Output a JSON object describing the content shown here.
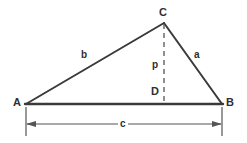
{
  "diagram": {
    "type": "triangle-with-altitude",
    "background_color": "#ffffff",
    "stroke_color": "#3a3a3a",
    "dim_stroke_color": "#555555",
    "labels": {
      "vertex_a": "A",
      "vertex_b": "B",
      "vertex_c": "C",
      "foot_d": "D",
      "side_a": "a",
      "side_b": "b",
      "altitude_p": "p",
      "base_c": "c"
    },
    "points": {
      "A": {
        "x": 26,
        "y": 104
      },
      "B": {
        "x": 222,
        "y": 104
      },
      "C": {
        "x": 164,
        "y": 23
      },
      "D": {
        "x": 164,
        "y": 104
      }
    },
    "segments": [
      {
        "name": "side-b-AC",
        "from": "A",
        "to": "C",
        "style": "solid",
        "label": "b"
      },
      {
        "name": "side-a-CB",
        "from": "C",
        "to": "B",
        "style": "solid",
        "label": "a"
      },
      {
        "name": "side-c-AB",
        "from": "A",
        "to": "B",
        "style": "solid",
        "label": "c"
      },
      {
        "name": "altitude-p-CD",
        "from": "C",
        "to": "D",
        "style": "dashed",
        "label": "p"
      }
    ],
    "dimension": {
      "name": "base-dimension-c",
      "label": "c",
      "from_x": 26,
      "to_x": 222,
      "line_y": 124,
      "extension_top_y": 107,
      "extension_bottom_y": 136,
      "arrows": "both"
    }
  }
}
